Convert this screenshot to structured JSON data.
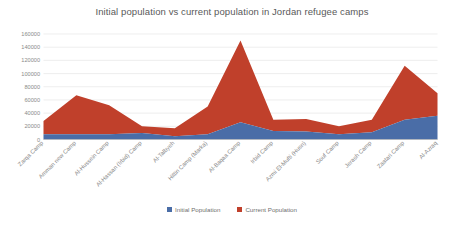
{
  "chart_data": {
    "type": "area",
    "stacked": true,
    "title": "Initial population vs current population in Jordan refugee camps",
    "xlabel": "",
    "ylabel": "",
    "ylim": [
      0,
      160000
    ],
    "ytick_step": 20000,
    "grid": true,
    "legend_position": "bottom",
    "categories": [
      "Zarqa Camp",
      "Amman new Camp",
      "Al-Hussein Camp",
      "Al-Hassan (Irbid) Camp",
      "Al-Talbyeh",
      "Hittin Camp (Marka)",
      "Al-Baqaa Camp",
      "Irbid Camp",
      "Azmi El-Mufti (Husn)",
      "Souf Camp",
      "Jerash Camp",
      "Zaatari Camp",
      "Al-Azraq"
    ],
    "yticks": [
      0,
      20000,
      40000,
      60000,
      80000,
      100000,
      120000,
      140000,
      160000
    ],
    "ytick_labels": [
      "0",
      "20000",
      "40000",
      "60000",
      "80000",
      "100000",
      "120000",
      "140000",
      "160000"
    ],
    "series": [
      {
        "name": "Initial Population",
        "color": "#4A6DA7",
        "values": [
          8000,
          8000,
          8000,
          10000,
          5000,
          8000,
          26000,
          13000,
          12000,
          8000,
          11000,
          30000,
          36000
        ]
      },
      {
        "name": "Current Population",
        "color": "#C0402B",
        "values": [
          20000,
          59000,
          44000,
          10000,
          12000,
          42000,
          124000,
          17000,
          19000,
          12000,
          19000,
          82000,
          34000
        ]
      }
    ],
    "legend": [
      {
        "label": "Initial Population",
        "color": "#4A6DA7",
        "marker": "square-swatch"
      },
      {
        "label": "Current Population",
        "color": "#C0402B",
        "marker": "square-swatch"
      }
    ]
  }
}
